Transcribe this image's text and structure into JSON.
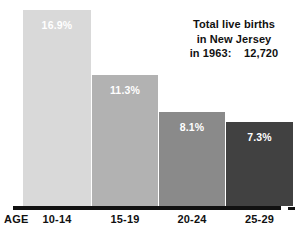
{
  "chart_data": {
    "type": "bar",
    "title": "",
    "subtitle": "",
    "xlabel": "AGE",
    "ylabel": "",
    "categories": [
      "10-14",
      "15-19",
      "20-24",
      "25-29"
    ],
    "values": [
      16.9,
      11.3,
      8.1,
      7.3
    ],
    "value_labels": [
      "16.9%",
      "11.3%",
      "8.1%",
      "7.3%"
    ],
    "bar_colors": [
      "#d9d9d9",
      "#b2b2b2",
      "#8a8a8a",
      "#414141"
    ],
    "value_label_color": "#ffffff",
    "ylim": [
      0,
      17.8
    ],
    "grid": false,
    "legend": null,
    "annotations": [
      "Total live births",
      "in New Jersey",
      "in 1963:    12,720"
    ]
  },
  "axis": {
    "name_label": "AGE",
    "line_color": "#111111"
  },
  "colors": {
    "background": "#ffffff",
    "text": "#111111"
  }
}
